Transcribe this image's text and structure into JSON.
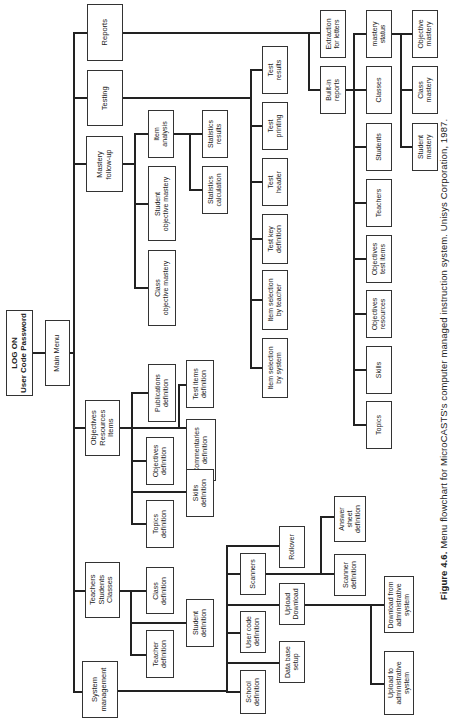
{
  "figure": {
    "caption_label": "Figure 4.6.",
    "caption_text": " Menu flowchart for MicroCASTS's computer managed instruction system. Unisys Corporation, 1987."
  },
  "nodes": {
    "logon": "LOG ON\nUser Code Password",
    "main_menu": "Main Menu",
    "reports": "Reports",
    "testing": "Testing",
    "mastery_followup": "Mastery\nfollow-up",
    "item_analysis": "Item\nanalysis",
    "student_objective_mastery": "Student\nobjective mastery",
    "class_objective_mastery": "Class\nobjective mastery",
    "statistics_results": "Statistics\nresults",
    "statistics_calculation": "Statistics\ncalculation",
    "test_results": "Test\nresults",
    "test_printing": "Test\nprinting",
    "test_header": "Test\nheader",
    "test_key_definition": "Test key\ndefinition",
    "item_selection_teacher": "Item selection\nby teacher",
    "item_selection_system": "Item selection\nby system",
    "extraction_letters": "Extraction\nfor letters",
    "builtin_reports": "Built-in\nreports",
    "mastery_status": "mastery\nstatus",
    "classes": "Classes",
    "students": "Students",
    "teachers": "Teachers",
    "objectives_test_items": "Objectives\ntest items",
    "objectives_resources": "Objectives\nresources",
    "skills": "Skills",
    "topics": "Topics",
    "objective_mastery": "Objective\nmastery",
    "class_mastery": "Class\nmastery",
    "student_mastery": "Student\nmastery",
    "objectives_resources_items": "Objectives\nResources\nItems",
    "publications_definition": "Publications\ndefinition",
    "test_items_definition": "Test items\ndefinition",
    "objectives_definition": "Objectives\ndefinition",
    "commentaries_definition": "Commentaries\ndefinition",
    "topics_definition": "Topics\ndefinition",
    "skills_definition": "Skills\ndefinition",
    "teachers_students_classes": "Teachers\nStudents\nClasses",
    "class_definition": "Class\ndefinition",
    "teacher_definition": "Teacher\ndefinition",
    "student_definition": "Student\ndefinition",
    "system_management": "System\nmanagement",
    "school_definition": "School\ndefinition",
    "data_base_setup": "Data base\nsetup",
    "user_code_definition": "User code\ndefinition",
    "upload_download": "Upload\nDownload",
    "scanners": "Scanners",
    "rollover": "Rollover",
    "scanner_definition": "Scanner\ndefinition",
    "answer_sheet_definition": "Answer\nsheet\ndefinition",
    "download_from_admin": "Download from\nadministrative\nsystem",
    "upload_to_admin": "Upload to\nadministrative\nsystem"
  }
}
